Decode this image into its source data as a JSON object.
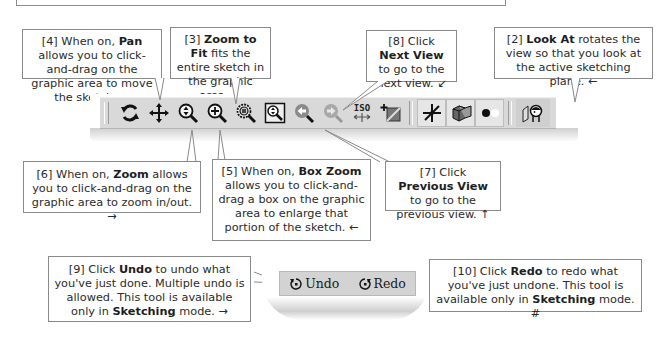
{
  "callouts": {
    "pan": {
      "num": "[4]",
      "pre": " When on, ",
      "bold": "Pan",
      "post": " allows you to click-and-drag on the graphic area to move the sketch. ",
      "arrow": "↘"
    },
    "zoom_to_fit": {
      "num": "[3] ",
      "bold": "Zoom to Fit",
      "post": " fits the entire sketch in the graphic area. ",
      "arrow": "←"
    },
    "next_view": {
      "num": "[8] Click ",
      "bold": "Next View",
      "post": " to go to the next view. ",
      "arrow": "↙"
    },
    "look_at": {
      "num": "[2] ",
      "bold": "Look At",
      "post": " rotates the view so that you look at the active sketching plane. ",
      "arrow": "←"
    },
    "zoom": {
      "num": "[6]",
      "pre": " When on, ",
      "bold": "Zoom",
      "post": " allows you to click-and-drag on the graphic area to zoom in/out. ",
      "arrow": "→"
    },
    "box_zoom": {
      "num": "[5]",
      "pre": " When on, ",
      "bold": "Box Zoom",
      "post": " allows you to click-and-drag a box on the graphic area to enlarge that portion of the sketch. ",
      "arrow": "←"
    },
    "previous_view": {
      "num": "[7] Click ",
      "bold": "Previous View",
      "post": " to go to the previous view. ",
      "arrow": "↑"
    },
    "undo": {
      "num": "[9] Click ",
      "bold": "Undo",
      "post": " to undo what you've just done. Multiple undo is allowed. This tool is available only in ",
      "bold2": "Sketching",
      "post2": " mode. ",
      "arrow": "→"
    },
    "redo": {
      "num": "[10] Click ",
      "bold": "Redo",
      "post": " to redo what you've just undone. This tool is available only in ",
      "bold2": "Sketching",
      "post2": " mode. ",
      "arrow": "#"
    }
  },
  "toolbar": {
    "buttons": [
      {
        "id": "rotate",
        "tooltip": "Rotate"
      },
      {
        "id": "pan",
        "tooltip": "Pan"
      },
      {
        "id": "zoom",
        "tooltip": "Zoom"
      },
      {
        "id": "box-zoom",
        "tooltip": "Box Zoom"
      },
      {
        "id": "zoom-to-fit",
        "tooltip": "Zoom to Fit"
      },
      {
        "id": "zoom-selected",
        "tooltip": "Zoom to Selection"
      },
      {
        "id": "previous-view",
        "tooltip": "Previous View"
      },
      {
        "id": "next-view",
        "tooltip": "Next View"
      },
      {
        "id": "iso-view",
        "tooltip": "ISO",
        "label": "ISO"
      },
      {
        "id": "new-sketch",
        "tooltip": "New Sketch"
      },
      {
        "id": "sketch-view",
        "tooltip": "Sketch"
      },
      {
        "id": "display-style",
        "tooltip": "Display"
      },
      {
        "id": "points",
        "tooltip": "Points"
      },
      {
        "id": "look-at",
        "tooltip": "Look At"
      }
    ]
  },
  "undo_redo": {
    "undo_label": "Undo",
    "redo_label": "Redo"
  },
  "colors": {
    "toolbar_bg": "#d9d9d9",
    "border": "#8a8a8a",
    "icon_dark": "#1a1a1a",
    "icon_gray": "#8f8f8f"
  }
}
